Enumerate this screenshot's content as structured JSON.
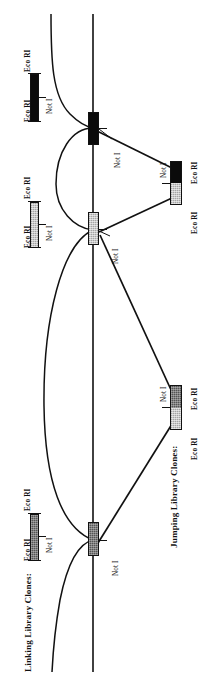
{
  "figure": {
    "orientation": "rotated-90-ccw",
    "background": "#ffffff",
    "line_color": "#111111",
    "genomic_axis_label": "",
    "colors": {
      "black": "#0b0b0b",
      "dark_gray": "#555555",
      "light_gray": "#c9c9c9",
      "outline": "#111111"
    }
  },
  "categories": [
    {
      "id": "linking",
      "label": "Linking Library Clones:"
    },
    {
      "id": "jumping",
      "label": "Jumping Library Clones:"
    }
  ],
  "site_labels": {
    "eco": "Eco RI",
    "not": "Not I"
  },
  "legend": [
    {
      "id": "legend-linking-black",
      "category": "linking",
      "fill": "black",
      "left_site": "Eco RI",
      "right_site": "Eco RI",
      "center_site": "Not I"
    },
    {
      "id": "legend-linking-ltgray",
      "category": "linking",
      "fill": "light_gray",
      "left_site": "Eco RI",
      "right_site": "Eco RI",
      "center_site": "Not I"
    },
    {
      "id": "legend-linking-dkgray",
      "category": "linking",
      "fill": "dark_gray",
      "left_site": "Eco RI",
      "right_site": "Eco RI",
      "center_site": "Not I"
    }
  ],
  "genomic_boxes": [
    {
      "id": "genomic-box-black",
      "fill": "black",
      "site": "Not I"
    },
    {
      "id": "genomic-box-ltgray",
      "fill": "light_gray",
      "site": "Not I"
    },
    {
      "id": "genomic-box-dkgray",
      "fill": "dark_gray",
      "site": "Not I"
    }
  ],
  "jumping_clones": [
    {
      "id": "jumping-clone-upper",
      "top_fill": "black",
      "bottom_fill": "light_gray",
      "left_site": "Eco RI",
      "right_site": "Eco RI",
      "center_site": "Not I"
    },
    {
      "id": "jumping-clone-lower",
      "top_fill": "dark_gray",
      "bottom_fill": "light_gray",
      "left_site": "Eco RI",
      "right_site": "Eco RI",
      "center_site": "Not I"
    }
  ]
}
